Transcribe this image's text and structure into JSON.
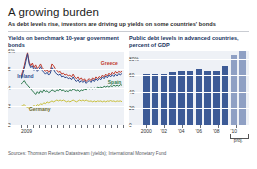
{
  "header": {
    "title": "A growing burden",
    "subtitle": "As debt levels rise, investors are driving up yields on some countries' bonds"
  },
  "panels": {
    "left": {
      "heading": "Yields on benchmark 10-year\ngovernment bonds"
    },
    "right": {
      "heading": "Public debt levels in advanced\ncountries, percent of GDP"
    }
  },
  "footer": {
    "sources": "Sources: Thomson Reuters Datastream (yields); International Monetary Fund"
  },
  "chart_data": [
    {
      "type": "line",
      "title": "Yields on benchmark 10-year government bonds",
      "xlabel": "",
      "ylabel": "percent",
      "ylim": [
        2,
        6
      ],
      "yticks": [
        "6%",
        "5",
        "4",
        "3",
        "2"
      ],
      "ytick_values": [
        6,
        5,
        4,
        3,
        2
      ],
      "xticks": [
        "2009"
      ],
      "xtick_count": 18,
      "grid": true,
      "legend": "inline-labels",
      "series": [
        {
          "name": "Greece",
          "color": "#c0392b",
          "label_x_pct": 80,
          "label_y_pct": 14,
          "values": [
            4.6,
            4.9,
            5.2,
            5.6,
            5.9,
            5.4,
            5.2,
            5.35,
            5.1,
            5.25,
            5.05,
            5.15,
            5.3,
            5.1,
            5.0,
            4.9,
            5.0,
            4.85,
            4.95,
            5.3,
            5.2,
            5.05,
            4.95,
            4.85,
            4.9,
            4.75,
            4.8,
            4.7,
            4.75,
            4.65,
            4.7,
            4.6,
            4.75,
            4.6,
            4.5,
            4.6,
            4.45,
            4.55,
            4.4,
            4.5,
            4.35,
            4.45,
            4.5,
            4.4,
            4.55,
            4.45,
            4.6,
            4.5,
            4.62,
            4.55,
            4.7,
            4.6,
            4.75,
            4.65,
            4.8,
            4.7,
            4.85,
            4.75,
            4.9,
            4.8,
            4.9,
            4.85,
            4.9
          ]
        },
        {
          "name": "Ireland",
          "color": "#2e4a8f",
          "label_x_pct": 8,
          "label_y_pct": 32,
          "values": [
            4.5,
            4.75,
            5.05,
            5.45,
            5.85,
            5.3,
            5.1,
            5.2,
            4.95,
            5.1,
            4.9,
            5.0,
            5.15,
            4.95,
            4.85,
            4.75,
            4.85,
            4.7,
            4.8,
            5.1,
            5.0,
            4.85,
            4.75,
            4.7,
            4.75,
            4.6,
            4.65,
            4.55,
            4.6,
            4.5,
            4.55,
            4.45,
            4.6,
            4.45,
            4.35,
            4.45,
            4.3,
            4.4,
            4.3,
            4.4,
            4.25,
            4.35,
            4.4,
            4.3,
            4.45,
            4.35,
            4.5,
            4.4,
            4.52,
            4.45,
            4.6,
            4.5,
            4.65,
            4.55,
            4.7,
            4.6,
            4.72,
            4.62,
            4.75,
            4.65,
            4.78,
            4.7,
            4.8
          ]
        },
        {
          "name": "Spain",
          "color": "#2f7a4f",
          "label_x_pct": 86,
          "label_y_pct": 40,
          "values": [
            4.2,
            4.3,
            4.4,
            4.25,
            4.15,
            4.05,
            3.95,
            3.85,
            3.75,
            3.65,
            3.8,
            3.7,
            3.85,
            3.75,
            3.9,
            3.8,
            3.85,
            3.75,
            3.8,
            3.9,
            3.85,
            3.8,
            3.9,
            3.85,
            3.95,
            3.85,
            3.9,
            3.8,
            3.85,
            3.8,
            3.9,
            3.85,
            3.95,
            3.9,
            3.85,
            3.9,
            3.8,
            3.9,
            3.85,
            3.95,
            3.9,
            4.0,
            3.95,
            4.0,
            3.95,
            4.0,
            3.95,
            4.05,
            4.0,
            4.05,
            4.0,
            4.1,
            4.05,
            4.1,
            4.05,
            4.12,
            4.08,
            4.15,
            4.1,
            4.15,
            4.1,
            4.18,
            4.15
          ]
        },
        {
          "name": "Germany",
          "color": "#c9c03a",
          "label_x_pct": 18,
          "label_y_pct": 76,
          "values": [
            3.0,
            3.05,
            3.1,
            3.0,
            2.95,
            2.9,
            2.95,
            3.0,
            3.05,
            3.0,
            3.1,
            3.05,
            3.15,
            3.1,
            3.2,
            3.15,
            3.25,
            3.2,
            3.25,
            3.3,
            3.25,
            3.3,
            3.35,
            3.3,
            3.35,
            3.3,
            3.35,
            3.3,
            3.25,
            3.3,
            3.25,
            3.3,
            3.35,
            3.3,
            3.25,
            3.3,
            3.35,
            3.3,
            3.35,
            3.3,
            3.35,
            3.3,
            3.28,
            3.3,
            3.25,
            3.3,
            3.25,
            3.3,
            3.28,
            3.3,
            3.25,
            3.3,
            3.25,
            3.3,
            3.28,
            3.32,
            3.28,
            3.3,
            3.26,
            3.3,
            3.28,
            3.3,
            3.26
          ]
        }
      ]
    },
    {
      "type": "bar",
      "title": "Public debt levels in advanced countries, percent of GDP",
      "xlabel": "",
      "ylabel": "percent of GDP",
      "ylim": [
        0,
        90
      ],
      "yticks": [
        "80%",
        "60",
        "40",
        "20",
        "0"
      ],
      "ytick_values": [
        80,
        60,
        40,
        20,
        0
      ],
      "categories": [
        "2000",
        "'01",
        "'02",
        "'03",
        "'04",
        "'05",
        "'06",
        "'07",
        "'08",
        "'09",
        "'10"
      ],
      "xtick_labels": [
        "2000",
        "'02",
        "'04",
        "'06",
        "'08",
        "'10"
      ],
      "values": [
        61,
        61,
        62,
        64,
        65,
        65,
        67,
        65,
        65,
        71,
        84,
        89
      ],
      "bar_color": "#3c5a96",
      "proj_color": "#8fa0c4",
      "projected_from_index": 10,
      "proj_note": "proj.",
      "grid": true
    }
  ]
}
